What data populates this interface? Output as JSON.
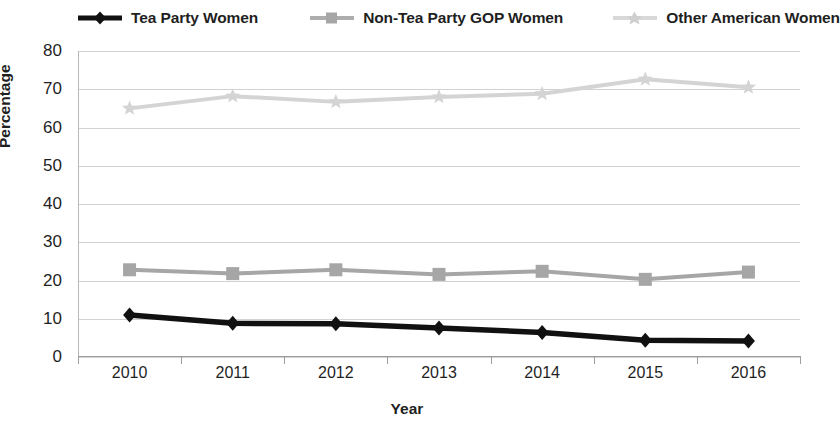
{
  "chart_data": {
    "type": "line",
    "title": "",
    "xlabel": "Year",
    "ylabel": "Percentage",
    "categories": [
      "2010",
      "2011",
      "2012",
      "2013",
      "2014",
      "2015",
      "2016"
    ],
    "x": [
      2010,
      2011,
      2012,
      2013,
      2014,
      2015,
      2016
    ],
    "ylim": [
      0,
      80
    ],
    "yticks": [
      0,
      10,
      20,
      30,
      40,
      50,
      60,
      70,
      80
    ],
    "ytick_labels": [
      "0",
      "10",
      "20",
      "30",
      "40",
      "50",
      "60",
      "70",
      "80"
    ],
    "grid": true,
    "legend_position": "top",
    "series": [
      {
        "name": "Tea Party Women",
        "color": "#111111",
        "marker": "diamond",
        "values": [
          11.0,
          8.8,
          8.7,
          7.6,
          6.4,
          4.4,
          4.2
        ]
      },
      {
        "name": "Non-Tea Party GOP Women",
        "color": "#a6a6a6",
        "marker": "square",
        "values": [
          22.8,
          21.8,
          22.8,
          21.6,
          22.4,
          20.3,
          22.2
        ]
      },
      {
        "name": "Other American Women",
        "color": "#d4d4d4",
        "marker": "star",
        "values": [
          65.0,
          68.2,
          66.7,
          68.0,
          68.8,
          72.6,
          70.5
        ]
      }
    ]
  },
  "legend": {
    "items": [
      {
        "label": "Tea Party Women",
        "color": "#111111",
        "marker": "diamond"
      },
      {
        "label": "Non-Tea Party GOP Women",
        "color": "#a6a6a6",
        "marker": "square"
      },
      {
        "label": "Other American Women",
        "color": "#d4d4d4",
        "marker": "star"
      }
    ]
  },
  "axes": {
    "y_title": "Percentage",
    "x_title": "Year"
  }
}
